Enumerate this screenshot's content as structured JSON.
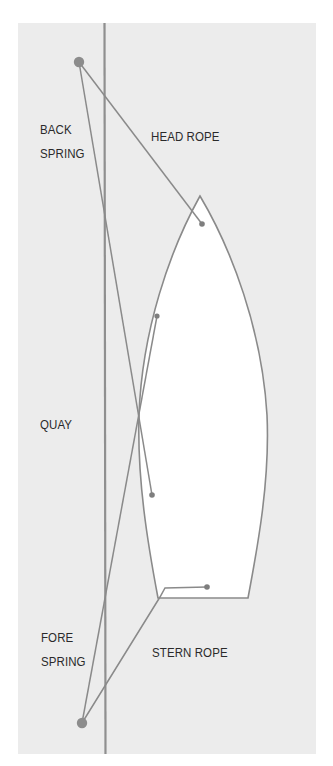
{
  "diagram": {
    "colors": {
      "background": "#ffffff",
      "panel": "#ececec",
      "line": "#8a8a8a",
      "quay": "#8f8f8f",
      "hull_fill": "#ffffff",
      "hull_stroke": "#8a8a8a",
      "bollard": "#8c8c8c",
      "cleat": "#7e7e7e",
      "text": "#2a2a2a"
    },
    "labels": {
      "back_spring_line1": "BACK",
      "back_spring_line2": "SPRING",
      "head_rope": "HEAD ROPE",
      "quay": "QUAY",
      "fore_spring_line1": "FORE",
      "fore_spring_line2": "SPRING",
      "stern_rope": "STERN ROPE"
    },
    "nodes": {
      "bollard_top": {
        "x": 79,
        "y": 62
      },
      "bollard_bottom": {
        "x": 82,
        "y": 723
      },
      "cleat_bow": {
        "x": 202,
        "y": 224
      },
      "cleat_fore_spring": {
        "x": 157,
        "y": 316
      },
      "cleat_back_spring": {
        "x": 152,
        "y": 495
      },
      "cleat_stern": {
        "x": 207,
        "y": 587
      }
    },
    "ropes": [
      {
        "name": "Head rope",
        "from": "bollard_top",
        "to": "cleat_bow"
      },
      {
        "name": "Back spring",
        "from": "bollard_top",
        "to": "cleat_back_spring"
      },
      {
        "name": "Fore spring",
        "from": "bollard_bottom",
        "to": "cleat_fore_spring"
      },
      {
        "name": "Stern rope",
        "from": "bollard_bottom",
        "to": "cleat_stern"
      }
    ]
  }
}
